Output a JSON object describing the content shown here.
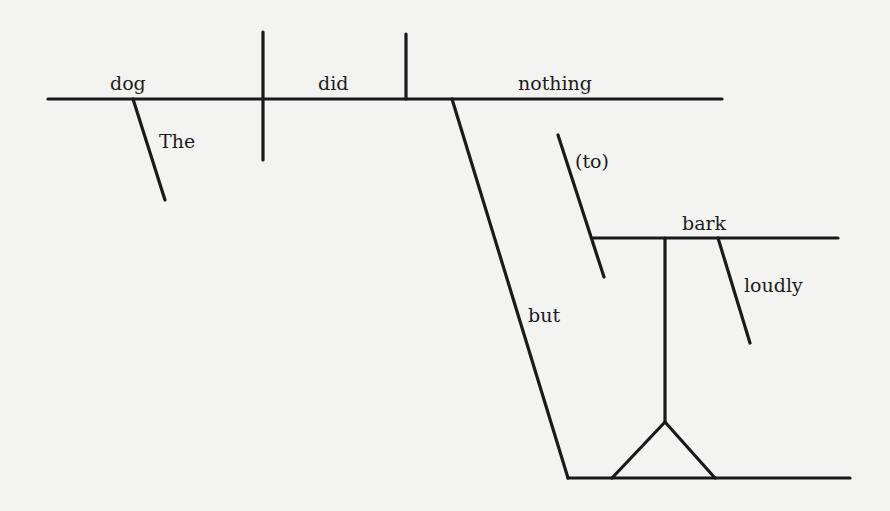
{
  "diagram": {
    "sentence": "The dog did nothing but (to) bark loudly",
    "ink_color": "#1a1a1a",
    "paper_color": "#f3f3f2",
    "words": {
      "subject": "dog",
      "subject_modifier": "The",
      "verb": "did",
      "object": "nothing",
      "conjunction": "but",
      "infinitive_marker": "(to)",
      "infinitive_verb": "bark",
      "adverb": "loudly"
    },
    "lines": [
      {
        "name": "main-baseline",
        "x1": 48,
        "y1": 99,
        "x2": 722,
        "y2": 99
      },
      {
        "name": "subject-predicate-divider",
        "x1": 263,
        "y1": 32,
        "x2": 263,
        "y2": 160
      },
      {
        "name": "verb-object-divider",
        "x1": 406,
        "y1": 34,
        "x2": 406,
        "y2": 99
      },
      {
        "name": "the-modifier-line",
        "x1": 133,
        "y1": 99,
        "x2": 165,
        "y2": 200
      },
      {
        "name": "but-connector-line",
        "x1": 452,
        "y1": 99,
        "x2": 568,
        "y2": 478
      },
      {
        "name": "bottom-line",
        "x1": 568,
        "y1": 478,
        "x2": 850,
        "y2": 478
      },
      {
        "name": "to-marker-line",
        "x1": 558,
        "y1": 135,
        "x2": 604,
        "y2": 277
      },
      {
        "name": "bark-baseline",
        "x1": 593,
        "y1": 238,
        "x2": 838,
        "y2": 238
      },
      {
        "name": "stem-line",
        "x1": 665,
        "y1": 238,
        "x2": 665,
        "y2": 422
      },
      {
        "name": "fork-left-line",
        "x1": 665,
        "y1": 422,
        "x2": 612,
        "y2": 478
      },
      {
        "name": "fork-right-line",
        "x1": 665,
        "y1": 422,
        "x2": 715,
        "y2": 478
      },
      {
        "name": "loudly-modifier-line",
        "x1": 718,
        "y1": 238,
        "x2": 750,
        "y2": 343
      }
    ]
  }
}
